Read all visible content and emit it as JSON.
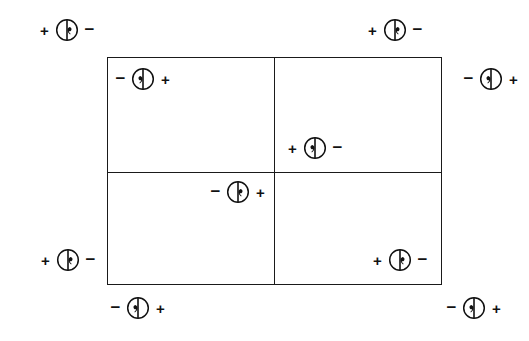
{
  "figure": {
    "background_color": "#ffffff",
    "line_color": "#1a1a1a",
    "symbol_name": "polarity-marker",
    "symbol_description": "Circle bisected by a vertical diameter with a comma-shaped tail on one side"
  },
  "rectangle": {
    "x": 107,
    "y": 57,
    "width": 335,
    "height": 228,
    "divider_vertical_x": 274,
    "divider_horizontal_y": 172,
    "quadrants": [
      "top-left",
      "top-right",
      "bottom-left",
      "bottom-right"
    ]
  },
  "markers": [
    {
      "id": "marker-outside-top-left",
      "name": "outside-top-left",
      "left_sign": "+",
      "right_sign": "−",
      "tail_side": "right",
      "x": 67,
      "y": 30
    },
    {
      "id": "marker-outside-top-right",
      "name": "outside-top-right",
      "left_sign": "+",
      "right_sign": "−",
      "tail_side": "right",
      "x": 395,
      "y": 30
    },
    {
      "id": "marker-inside-top-left",
      "name": "inside-top-left-quadrant",
      "left_sign": "−",
      "right_sign": "+",
      "tail_side": "left",
      "x": 143,
      "y": 79
    },
    {
      "id": "marker-outside-right-upper",
      "name": "outside-right-upper",
      "left_sign": "−",
      "right_sign": "+",
      "tail_side": "left",
      "x": 491,
      "y": 79
    },
    {
      "id": "marker-inside-center-upper",
      "name": "inside-top-right-quadrant",
      "left_sign": "+",
      "right_sign": "−",
      "tail_side": "left",
      "x": 315,
      "y": 148
    },
    {
      "id": "marker-inside-center-lower",
      "name": "inside-bottom-left-quadrant-upper",
      "left_sign": "−",
      "right_sign": "+",
      "tail_side": "right",
      "x": 238,
      "y": 192
    },
    {
      "id": "marker-outside-left-lower",
      "name": "outside-left-lower",
      "left_sign": "+",
      "right_sign": "−",
      "tail_side": "right",
      "x": 68,
      "y": 260
    },
    {
      "id": "marker-inside-bottom-right",
      "name": "inside-bottom-right-quadrant",
      "left_sign": "+",
      "right_sign": "−",
      "tail_side": "right",
      "x": 400,
      "y": 260
    },
    {
      "id": "marker-outside-bottom-left",
      "name": "outside-bottom-left",
      "left_sign": "−",
      "right_sign": "+",
      "tail_side": "left",
      "x": 138,
      "y": 308
    },
    {
      "id": "marker-outside-bottom-right",
      "name": "outside-bottom-right",
      "left_sign": "−",
      "right_sign": "+",
      "tail_side": "left",
      "x": 474,
      "y": 308
    }
  ]
}
